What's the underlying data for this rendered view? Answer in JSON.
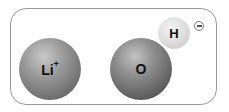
{
  "diagram": {
    "atoms": [
      {
        "id": "li",
        "symbol": "Li",
        "charge": "+"
      },
      {
        "id": "o",
        "symbol": "O"
      },
      {
        "id": "h",
        "symbol": "H"
      }
    ],
    "hydroxide_charge_icon": "minus-circle-icon"
  }
}
